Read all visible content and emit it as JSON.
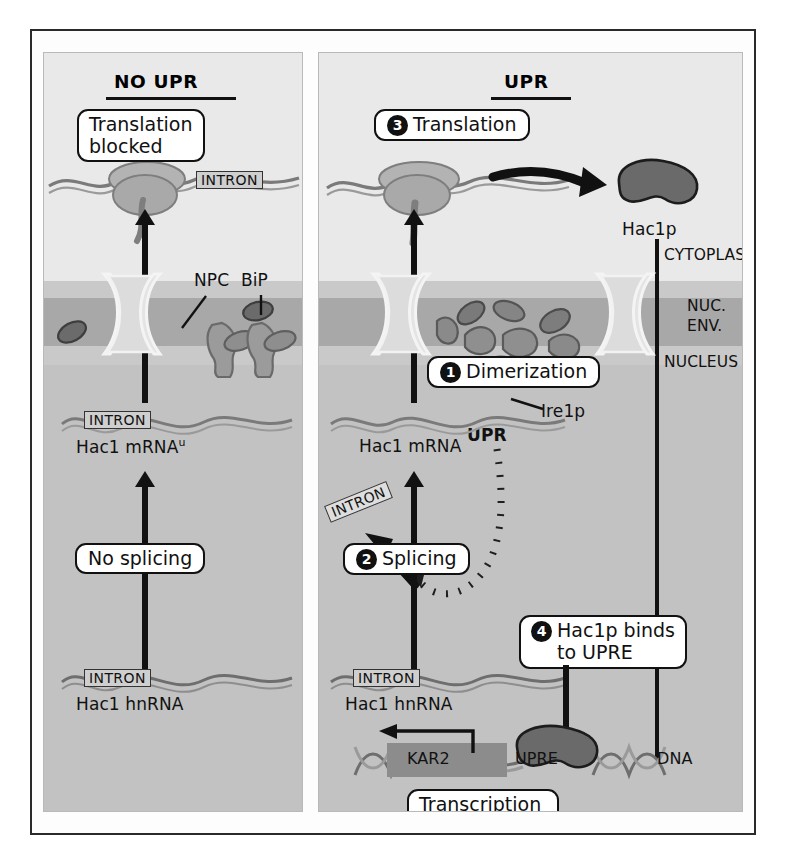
{
  "figure": {
    "colors": {
      "cytoplasm": "#e9e9e9",
      "nuclear_envelope": "#c9c9c9",
      "envelope_lumen": "#a8a8a8",
      "nucleus": "#c2c2c2",
      "protein_dark": "#5d5d5d",
      "protein_mid": "#8d8d8d",
      "protein_light": "#b3b3b3",
      "outline": "#111111",
      "frame": "#2a2a2a"
    }
  },
  "panels": {
    "left": {
      "title": "NO UPR",
      "callouts": {
        "translation_blocked": "Translation\nblocked",
        "no_splicing": "No splicing"
      },
      "labels": {
        "intron_mrna": "INTRON",
        "mrna": "Hac1 mRNA",
        "mrna_superscript": "u",
        "intron_hnrna": "INTRON",
        "hnrna": "Hac1 hnRNA",
        "npc": "NPC",
        "bip": "BiP",
        "intron_ribosome": "INTRON"
      }
    },
    "right": {
      "title": "UPR",
      "callouts": {
        "translation": {
          "step": "3",
          "text": "Translation"
        },
        "dimerization": {
          "step": "1",
          "text": "Dimerization"
        },
        "splicing": {
          "step": "2",
          "text": "Splicing"
        },
        "hac1p_binds": {
          "step": "4",
          "line1": "Hac1p binds",
          "line2": "to UPRE"
        },
        "transcription": {
          "line1": "Transcription",
          "line2": "of KAR2 gene"
        }
      },
      "labels": {
        "hac1p": "Hac1p",
        "cytoplasm": "CYTOPLASM",
        "nuc_env_line1": "NUC.",
        "nuc_env_line2": "ENV.",
        "nucleus": "NUCLEUS",
        "ire1p": "Ire1p",
        "upr_signal": "UPR",
        "mrna": "Hac1 mRNA",
        "intron_spliced": "INTRON",
        "intron_hnrna": "INTRON",
        "hnrna": "Hac1 hnRNA",
        "kar2": "KAR2",
        "upre": "UPRE",
        "dna": "DNA"
      }
    }
  }
}
